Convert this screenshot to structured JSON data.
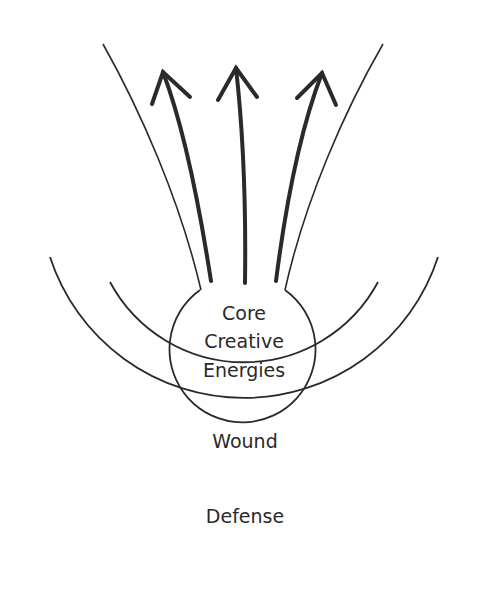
{
  "diagram": {
    "core_label_lines": [
      "Core",
      "Creative",
      "Energies"
    ],
    "wound_label": "Wound",
    "defense_label": "Defense",
    "arrows": [
      {
        "name": "left-arrow",
        "direction": "up-left"
      },
      {
        "name": "center-arrow",
        "direction": "up"
      },
      {
        "name": "right-arrow",
        "direction": "up-right"
      }
    ],
    "colors": {
      "stroke": "#2a2a2a",
      "background": "#ffffff"
    }
  }
}
